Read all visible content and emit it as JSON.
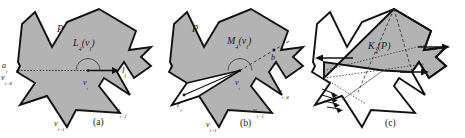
{
  "figure": {
    "type": "geometry-diagram",
    "background_color": "#ffffff",
    "polygon_fill": "#b3b3b3",
    "polygon_stroke": "#111111",
    "dashed_stroke": "#333333",
    "panels": [
      {
        "id": "a",
        "caption": "(a)",
        "main_label": "L",
        "main_sub": "4",
        "main_arg": "(v",
        "main_arg_sub": "i",
        "main_arg_close": ")",
        "labels": {
          "polygon": "P",
          "region": "L₄(vᵢ)",
          "a_i": "a",
          "a_i_sub": "i",
          "v_im4": "v",
          "v_im4_sub": "i−4",
          "v_i": "v",
          "v_i_sub": "i",
          "v_im1": "v",
          "v_im1_sub": "i−1",
          "v_ip1": "v",
          "v_ip1_sub": "i+1",
          "l_i": "l",
          "l_i_sub": "i"
        }
      },
      {
        "id": "b",
        "caption": "(b)",
        "labels": {
          "polygon": "P",
          "region": "M₄(vᵢ)",
          "b_i": "b",
          "b_i_sub": "i",
          "r_i": "r",
          "r_i_sub": "i",
          "v_i": "v",
          "v_i_sub": "i",
          "v_im1": "v",
          "v_im1_sub": "i−1",
          "v_ip1": "v",
          "v_ip1_sub": "i+1",
          "v_ip4": "v",
          "v_ip4_sub": "i+4"
        }
      },
      {
        "id": "c",
        "caption": "(c)",
        "labels": {
          "region": "K₄(P)"
        }
      }
    ]
  },
  "panel_a": {
    "P": "P",
    "region_main": "L",
    "region_sub": "4",
    "region_tail": "(v",
    "region_tail_sub": "i",
    "region_tail_end": ")",
    "a_i_main": "a",
    "a_i_sub": "i",
    "v_im4_main": "v",
    "v_im4_sub": "i−4",
    "v_i_main": "v",
    "v_i_sub": "i",
    "v_im1_main": "v",
    "v_im1_sub": "i−1",
    "v_ip1_main": "v",
    "v_ip1_sub": "i+1",
    "l_i_main": "l",
    "l_i_sub": "i",
    "caption": "(a)"
  },
  "panel_b": {
    "P": "P",
    "region_main": "M",
    "region_sub": "4",
    "region_tail": "(v",
    "region_tail_sub": "i",
    "region_tail_end": ")",
    "b_i_main": "b",
    "b_i_sub": "i",
    "r_i_main": "r",
    "r_i_sub": "i",
    "v_i_main": "v",
    "v_i_sub": "i",
    "v_im1_main": "v",
    "v_im1_sub": "i−1",
    "v_ip1_main": "v",
    "v_ip1_sub": "i+1",
    "v_ip4_main": "v",
    "v_ip4_sub": "i+4",
    "caption": "(b)"
  },
  "panel_c": {
    "region_main": "K",
    "region_sub": "4",
    "region_tail": "(P)",
    "caption": "(c)"
  }
}
